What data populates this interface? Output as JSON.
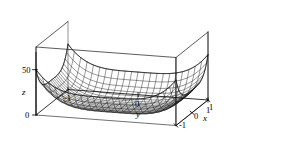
{
  "chart_data": {
    "type": "surface",
    "title": "",
    "xlabel": "x",
    "ylabel": "y",
    "zlabel": "z",
    "xlim": [
      -1,
      1
    ],
    "ylim": [
      -1,
      1
    ],
    "zlim": [
      0,
      75
    ],
    "xticks": [
      1,
      0,
      -1
    ],
    "xtick_labels": [
      "1",
      "0",
      "-1"
    ],
    "yticks": [
      -1,
      0,
      1
    ],
    "ytick_labels": [
      "-1",
      "0",
      "1"
    ],
    "zticks": [
      0,
      50
    ],
    "ztick_labels": [
      "0",
      "50"
    ],
    "grid": false,
    "legend": null,
    "surface_function": "z = 25*(x^4 + y^4)",
    "mesh_resolution": 22,
    "line_color": "#1a1a1a",
    "box_color": "#333333",
    "background_color": "#ffffff",
    "view": {
      "elevation_deg": 22,
      "azimuth_deg": 42
    }
  },
  "axes": {
    "z_label": "z",
    "y_label": "y",
    "x_label": "x",
    "z_tick_0": "0",
    "z_tick_50": "50",
    "y_tick_neg1": "-1",
    "y_tick_0": "0",
    "y_tick_1": "1",
    "x_tick_1": "1",
    "x_tick_0": "0",
    "x_tick_neg1": "-1"
  }
}
